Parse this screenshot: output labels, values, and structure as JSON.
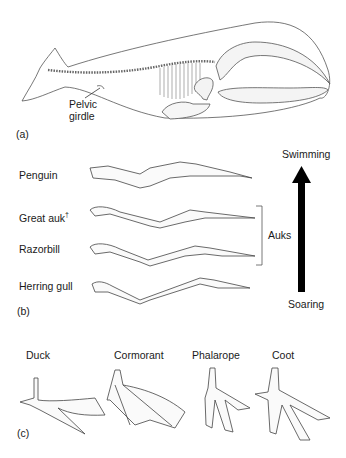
{
  "panels": {
    "a": {
      "label": "(a)",
      "subject": "whale skeleton",
      "annotation": {
        "line1": "Pelvic",
        "line2": "girdle"
      }
    },
    "b": {
      "label": "(b)",
      "rows": [
        {
          "name": "Penguin",
          "dagger": ""
        },
        {
          "name": "Great auk",
          "dagger": "†"
        },
        {
          "name": "Razorbill",
          "dagger": ""
        },
        {
          "name": "Herring gull",
          "dagger": ""
        }
      ],
      "bracket_label": "Auks",
      "arrow": {
        "top": "Swimming",
        "bottom": "Soaring"
      }
    },
    "c": {
      "label": "(c)",
      "feet": [
        "Duck",
        "Cormorant",
        "Phalarope",
        "Coot"
      ]
    }
  },
  "colors": {
    "line": "#444444",
    "arrow": "#000000",
    "background": "#ffffff"
  }
}
